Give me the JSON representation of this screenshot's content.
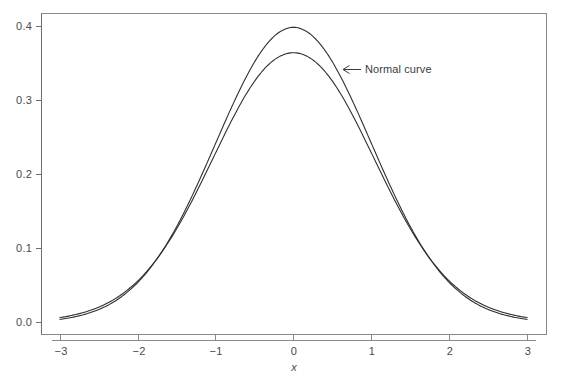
{
  "chart_data": {
    "type": "line",
    "title": "",
    "subtitle": "",
    "xlabel": "x",
    "ylabel": "",
    "xlim": [
      -3.1,
      3.1
    ],
    "ylim": [
      -0.005,
      0.418
    ],
    "grid": false,
    "legend_position": "none",
    "xticks": [
      -3,
      -2,
      -1,
      0,
      1,
      2,
      3
    ],
    "xtick_labels": [
      "−3",
      "−2",
      "−1",
      "0",
      "1",
      "2",
      "3"
    ],
    "yticks": [
      0.0,
      0.1,
      0.2,
      0.3,
      0.4
    ],
    "ytick_labels": [
      "0.0",
      "0.1",
      "0.2",
      "0.3",
      "0.4"
    ],
    "x": [
      -3.0,
      -2.8,
      -2.6,
      -2.4,
      -2.2,
      -2.0,
      -1.8,
      -1.6,
      -1.4,
      -1.2,
      -1.0,
      -0.8,
      -0.6,
      -0.4,
      -0.2,
      0.0,
      0.2,
      0.4,
      0.6,
      0.8,
      1.0,
      1.2,
      1.4,
      1.6,
      1.8,
      2.0,
      2.2,
      2.4,
      2.6,
      2.8,
      3.0
    ],
    "series": [
      {
        "name": "Normal curve",
        "peak": 0.3989,
        "values": [
          0.0044,
          0.0079,
          0.0136,
          0.0224,
          0.0355,
          0.054,
          0.079,
          0.1109,
          0.1497,
          0.1942,
          0.242,
          0.2897,
          0.3332,
          0.3683,
          0.391,
          0.3989,
          0.391,
          0.3683,
          0.3332,
          0.2897,
          0.242,
          0.1942,
          0.1497,
          0.1109,
          0.079,
          0.054,
          0.0355,
          0.0224,
          0.0136,
          0.0079,
          0.0044
        ]
      },
      {
        "name": "Flatter curve",
        "peak": 0.3618,
        "values": [
          0.0068,
          0.0107,
          0.0167,
          0.0256,
          0.0384,
          0.0561,
          0.0796,
          0.1094,
          0.1452,
          0.1859,
          0.2292,
          0.2718,
          0.3099,
          0.3397,
          0.3582,
          0.3646,
          0.3582,
          0.3397,
          0.3099,
          0.2718,
          0.2292,
          0.1859,
          0.1452,
          0.1094,
          0.0796,
          0.0561,
          0.0384,
          0.0256,
          0.0167,
          0.0107,
          0.0068
        ]
      }
    ],
    "annotations": [
      {
        "text": "Normal curve",
        "arrow_from_x": 0.86,
        "arrow_from_y": 0.347,
        "arrow_to_x": 0.64,
        "arrow_to_y": 0.347
      }
    ]
  },
  "colors": {
    "background": "#ffffff",
    "curve": "#2f2f2f",
    "frame": "#8a8a8a",
    "axis": "#6e6e6e",
    "text": "#4a4a4a"
  }
}
